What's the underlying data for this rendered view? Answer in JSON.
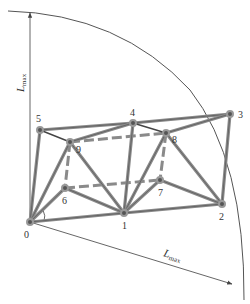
{
  "diagram": {
    "axes": {
      "vertical_label": "L",
      "vertical_label_sub": "max",
      "diagonal_label": "L",
      "diagonal_label_sub": "max"
    },
    "nodes": [
      {
        "id": "0",
        "label": "0",
        "x": 30,
        "y": 222
      },
      {
        "id": "1",
        "label": "1",
        "x": 124,
        "y": 213
      },
      {
        "id": "2",
        "label": "2",
        "x": 222,
        "y": 204
      },
      {
        "id": "3",
        "label": "3",
        "x": 230,
        "y": 114
      },
      {
        "id": "4",
        "label": "4",
        "x": 133,
        "y": 123
      },
      {
        "id": "5",
        "label": "5",
        "x": 40,
        "y": 130
      },
      {
        "id": "6",
        "label": "6",
        "x": 65,
        "y": 188
      },
      {
        "id": "7",
        "label": "7",
        "x": 160,
        "y": 180
      },
      {
        "id": "8",
        "label": "8",
        "x": 166,
        "y": 133
      },
      {
        "id": "9",
        "label": "9",
        "x": 70,
        "y": 142
      }
    ],
    "edges_solid": [
      [
        "0",
        "1"
      ],
      [
        "1",
        "2"
      ],
      [
        "2",
        "3"
      ],
      [
        "3",
        "4"
      ],
      [
        "4",
        "5"
      ],
      [
        "0",
        "5"
      ],
      [
        "0",
        "9"
      ],
      [
        "0",
        "6"
      ],
      [
        "6",
        "1"
      ],
      [
        "9",
        "1"
      ],
      [
        "1",
        "4"
      ],
      [
        "1",
        "8"
      ],
      [
        "1",
        "7"
      ],
      [
        "7",
        "2"
      ],
      [
        "8",
        "2"
      ],
      [
        "4",
        "8"
      ],
      [
        "8",
        "3"
      ],
      [
        "5",
        "9"
      ],
      [
        "9",
        "4"
      ]
    ],
    "edges_dashed": [
      [
        "6",
        "7"
      ],
      [
        "9",
        "8"
      ],
      [
        "9",
        "6"
      ],
      [
        "8",
        "7"
      ]
    ]
  }
}
